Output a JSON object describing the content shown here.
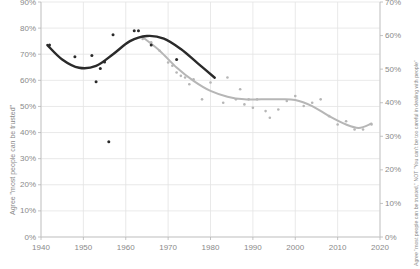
{
  "chart_data": {
    "type": "scatter",
    "title": "",
    "subtitle": "",
    "xlabel": "",
    "ylabel_left": "Agree \"most people can be trusted\"",
    "ylabel_right": "Agree \"most people can be trusted,\" NOT \"You can't be too careful in dealing with people\"",
    "xlim": [
      1940,
      2020
    ],
    "ylim_left": [
      0,
      90
    ],
    "ylim_right": [
      0,
      70
    ],
    "grid": true,
    "legend_position": "none",
    "xticks": [
      "1940",
      "1950",
      "1960",
      "1970",
      "1980",
      "1990",
      "2000",
      "2010",
      "2020"
    ],
    "xtick_values": [
      1940,
      1950,
      1960,
      1970,
      1980,
      1990,
      2000,
      2010,
      2020
    ],
    "yticks_left": [
      "90%",
      "80%",
      "70%",
      "60%",
      "50%",
      "40%",
      "30%",
      "20%",
      "10%",
      "0%"
    ],
    "ytick_values_left": [
      90,
      80,
      70,
      60,
      50,
      40,
      30,
      20,
      10,
      0
    ],
    "yticks_right": [
      "70%",
      "60%",
      "50%",
      "40%",
      "30%",
      "20%",
      "10%",
      "0%"
    ],
    "ytick_values_right": [
      70,
      60,
      50,
      40,
      30,
      20,
      10,
      0
    ],
    "series": [
      {
        "name": "dark-series",
        "axis": "left",
        "color": "#2a2a2a",
        "marker": "dot",
        "points": [
          {
            "x": 1942,
            "y": 73.5
          },
          {
            "x": 1948,
            "y": 69.0
          },
          {
            "x": 1952,
            "y": 69.5
          },
          {
            "x": 1953,
            "y": 59.5
          },
          {
            "x": 1954,
            "y": 64.5
          },
          {
            "x": 1955,
            "y": 67.0
          },
          {
            "x": 1957,
            "y": 77.5
          },
          {
            "x": 1962,
            "y": 79.0
          },
          {
            "x": 1963,
            "y": 79.0
          },
          {
            "x": 1966,
            "y": 73.5
          },
          {
            "x": 1972,
            "y": 68.0
          },
          {
            "x": 1956,
            "y": 36.5
          }
        ],
        "trend": [
          {
            "x": 1941.5,
            "y": 73.5
          },
          {
            "x": 1945,
            "y": 68.0
          },
          {
            "x": 1949,
            "y": 64.8
          },
          {
            "x": 1953,
            "y": 65.5
          },
          {
            "x": 1957,
            "y": 70.0
          },
          {
            "x": 1961,
            "y": 75.0
          },
          {
            "x": 1965,
            "y": 77.0
          },
          {
            "x": 1969,
            "y": 76.0
          },
          {
            "x": 1973,
            "y": 72.0
          },
          {
            "x": 1977,
            "y": 66.5
          },
          {
            "x": 1981,
            "y": 61.0
          }
        ]
      },
      {
        "name": "light-series",
        "axis": "right",
        "color": "#b6b6b6",
        "marker": "dot",
        "points": [
          {
            "x": 1964,
            "y": 59.0
          },
          {
            "x": 1966,
            "y": 58.0
          },
          {
            "x": 1968,
            "y": 55.5
          },
          {
            "x": 1970,
            "y": 52.0
          },
          {
            "x": 1971,
            "y": 51.0
          },
          {
            "x": 1972,
            "y": 49.0
          },
          {
            "x": 1973,
            "y": 48.0
          },
          {
            "x": 1974,
            "y": 47.5
          },
          {
            "x": 1975,
            "y": 45.5
          },
          {
            "x": 1976,
            "y": 47.0
          },
          {
            "x": 1978,
            "y": 41.0
          },
          {
            "x": 1980,
            "y": 46.0
          },
          {
            "x": 1983,
            "y": 40.0
          },
          {
            "x": 1984,
            "y": 47.5
          },
          {
            "x": 1986,
            "y": 41.0
          },
          {
            "x": 1987,
            "y": 44.0
          },
          {
            "x": 1988,
            "y": 39.5
          },
          {
            "x": 1989,
            "y": 41.0
          },
          {
            "x": 1990,
            "y": 38.5
          },
          {
            "x": 1991,
            "y": 41.0
          },
          {
            "x": 1993,
            "y": 37.5
          },
          {
            "x": 1994,
            "y": 35.5
          },
          {
            "x": 1996,
            "y": 38.0
          },
          {
            "x": 1998,
            "y": 40.5
          },
          {
            "x": 2000,
            "y": 42.0
          },
          {
            "x": 2002,
            "y": 39.0
          },
          {
            "x": 2004,
            "y": 40.0
          },
          {
            "x": 2006,
            "y": 41.0
          },
          {
            "x": 2008,
            "y": 36.0
          },
          {
            "x": 2010,
            "y": 33.5
          },
          {
            "x": 2012,
            "y": 34.5
          },
          {
            "x": 2014,
            "y": 32.0
          },
          {
            "x": 2016,
            "y": 32.0
          },
          {
            "x": 2018,
            "y": 33.5
          }
        ],
        "trend": [
          {
            "x": 1964,
            "y": 59.5
          },
          {
            "x": 1968,
            "y": 55.5
          },
          {
            "x": 1972,
            "y": 50.5
          },
          {
            "x": 1976,
            "y": 46.5
          },
          {
            "x": 1980,
            "y": 43.5
          },
          {
            "x": 1984,
            "y": 41.8
          },
          {
            "x": 1988,
            "y": 41.0
          },
          {
            "x": 1992,
            "y": 41.0
          },
          {
            "x": 1996,
            "y": 41.0
          },
          {
            "x": 2000,
            "y": 40.8
          },
          {
            "x": 2004,
            "y": 39.0
          },
          {
            "x": 2008,
            "y": 36.0
          },
          {
            "x": 2012,
            "y": 33.5
          },
          {
            "x": 2015,
            "y": 32.5
          },
          {
            "x": 2018,
            "y": 33.8
          }
        ]
      }
    ]
  }
}
